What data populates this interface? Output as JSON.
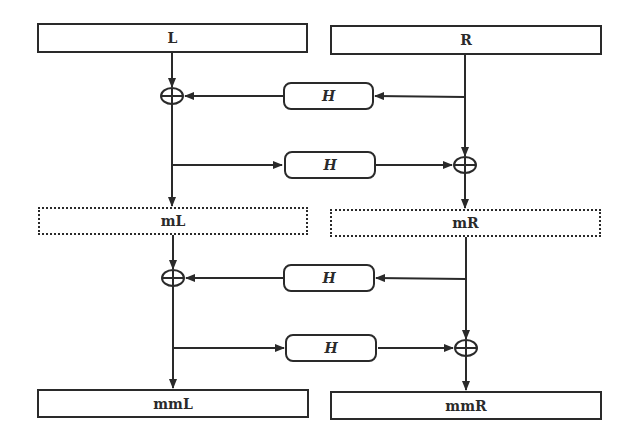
{
  "diagram": {
    "type": "feistel-like-network",
    "colors": {
      "stroke": "#2a2a2a",
      "background": "#ffffff"
    },
    "blocks": {
      "L": {
        "label": "L",
        "style": "solid"
      },
      "R": {
        "label": "R",
        "style": "solid"
      },
      "mL": {
        "label": "mL",
        "style": "dashed"
      },
      "mR": {
        "label": "mR",
        "style": "dashed"
      },
      "mmL": {
        "label": "mmL",
        "style": "solid"
      },
      "mmR": {
        "label": "mmR",
        "style": "solid"
      }
    },
    "functions": [
      {
        "id": "H1",
        "label": "H",
        "input": "R",
        "output": "xor1"
      },
      {
        "id": "H2",
        "label": "H",
        "input": "L-branch",
        "output": "xor2"
      },
      {
        "id": "H3",
        "label": "H",
        "input": "mR",
        "output": "xor3"
      },
      {
        "id": "H4",
        "label": "H",
        "input": "mL-branch",
        "output": "xor4"
      }
    ],
    "xor_nodes": [
      {
        "id": "xor1",
        "symbol": "⊕",
        "column": "left",
        "inputs": [
          "L",
          "H1"
        ],
        "output": "mL"
      },
      {
        "id": "xor2",
        "symbol": "⊕",
        "column": "right",
        "inputs": [
          "R",
          "H2"
        ],
        "output": "mR"
      },
      {
        "id": "xor3",
        "symbol": "⊕",
        "column": "left",
        "inputs": [
          "mL",
          "H3"
        ],
        "output": "mmL"
      },
      {
        "id": "xor4",
        "symbol": "⊕",
        "column": "right",
        "inputs": [
          "mR",
          "H4"
        ],
        "output": "mmR"
      }
    ],
    "edges": [
      {
        "from": "L",
        "to": "xor1"
      },
      {
        "from": "R",
        "to": "H1"
      },
      {
        "from": "H1",
        "to": "xor1"
      },
      {
        "from": "xor1",
        "to": "mL"
      },
      {
        "from": "xor1",
        "to": "H2"
      },
      {
        "from": "H2",
        "to": "xor2"
      },
      {
        "from": "R",
        "to": "xor2"
      },
      {
        "from": "xor2",
        "to": "mR"
      },
      {
        "from": "mL",
        "to": "xor3"
      },
      {
        "from": "mR",
        "to": "H3"
      },
      {
        "from": "H3",
        "to": "xor3"
      },
      {
        "from": "xor3",
        "to": "mmL"
      },
      {
        "from": "xor3",
        "to": "H4"
      },
      {
        "from": "H4",
        "to": "xor4"
      },
      {
        "from": "mR",
        "to": "xor4"
      },
      {
        "from": "xor4",
        "to": "mmR"
      }
    ]
  }
}
